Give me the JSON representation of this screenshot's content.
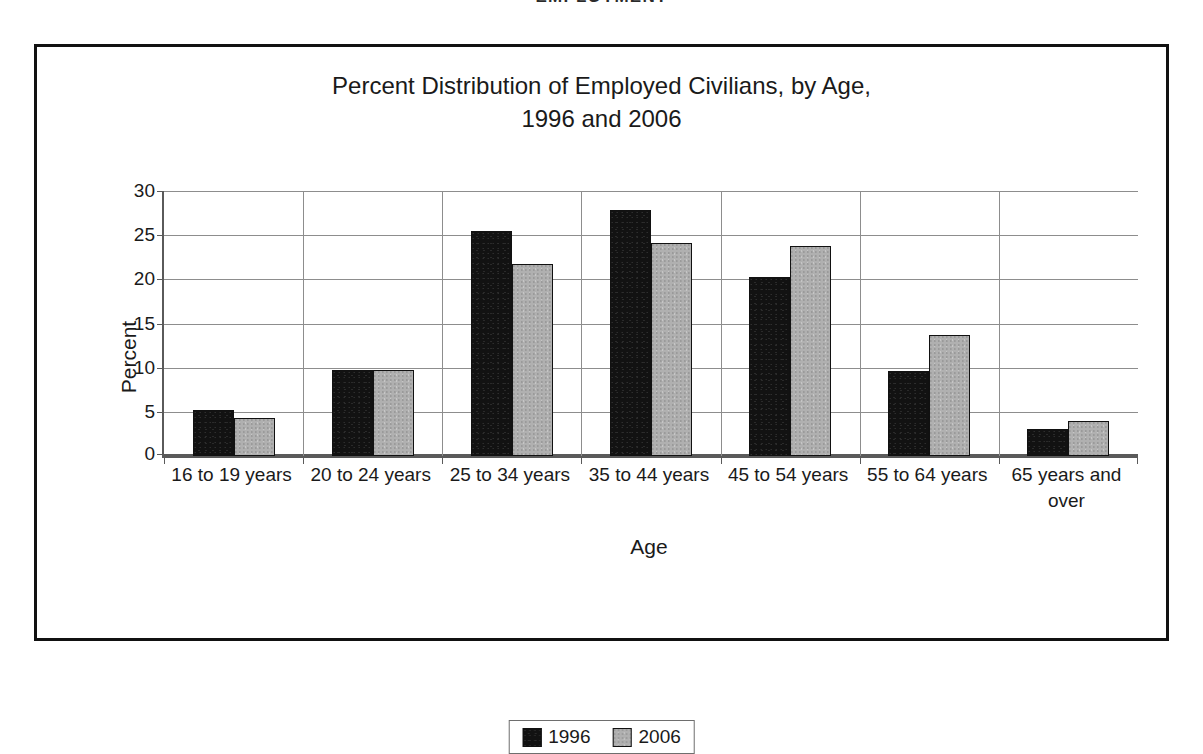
{
  "document": {
    "running_heading": "EMPLOYMENT"
  },
  "chart_data": {
    "type": "bar",
    "title": "Percent Distribution of Employed Civilians, by Age, 1996 and 2006",
    "title_line1": "Percent Distribution of Employed Civilians, by Age,",
    "title_line2": "1996 and 2006",
    "xlabel": "Age",
    "ylabel": "Percent",
    "ylim": [
      0,
      30
    ],
    "yticks": [
      0,
      5,
      10,
      15,
      20,
      25,
      30
    ],
    "ytick_labels": [
      "0",
      "5",
      "10",
      "15",
      "20",
      "25",
      "30"
    ],
    "grid": true,
    "legend_position": "bottom",
    "categories": [
      "16 to 19 years",
      "20 to 24 years",
      "25 to 34 years",
      "35 to 44 years",
      "45 to 54 years",
      "55 to 64 years",
      "65 years and over"
    ],
    "series": [
      {
        "name": "1996",
        "color": "#121212",
        "values": [
          5.2,
          9.7,
          25.5,
          27.9,
          20.3,
          9.6,
          3.1
        ]
      },
      {
        "name": "2006",
        "color": "#b0b0b0",
        "values": [
          4.3,
          9.7,
          21.7,
          24.1,
          23.8,
          13.7,
          4.0
        ]
      }
    ]
  }
}
